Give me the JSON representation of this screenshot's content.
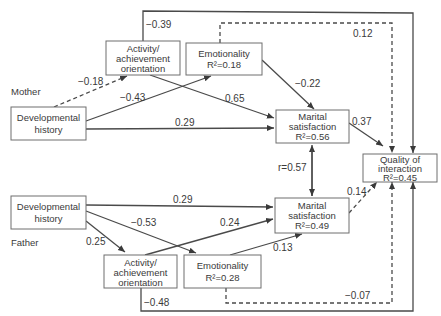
{
  "groups": {
    "mother": "Mother",
    "father": "Father"
  },
  "nodes": {
    "mother_dev": {
      "line1": "Developmental",
      "line2": "history"
    },
    "mother_activity": {
      "line1": "Activity/",
      "line2": "achievement",
      "line3": "orientation"
    },
    "mother_emotion": {
      "line1": "Emotionality",
      "r2": "R²=0.18"
    },
    "mother_marital": {
      "line1": "Marital",
      "line2": "satisfaction",
      "r2": "R²=0.56"
    },
    "quality": {
      "line1": "Quality of",
      "line2": "interaction",
      "r2": "R²=0.45"
    },
    "father_dev": {
      "line1": "Developmental",
      "line2": "history"
    },
    "father_activity": {
      "line1": "Activity/",
      "line2": "achievement",
      "line3": "orientation"
    },
    "father_emotion": {
      "line1": "Emotionality",
      "r2": "R²=0.28"
    },
    "father_marital": {
      "line1": "Marital",
      "line2": "satisfaction",
      "r2": "R²=0.49"
    }
  },
  "paths": {
    "m_activity_quality": "−0.39",
    "m_emotion_quality": "0.12",
    "m_dev_activity": "−0.18",
    "m_dev_emotion": "−0.43",
    "m_emotion_marital": "−0.22",
    "m_activity_marital": "0.65",
    "m_dev_marital": "0.29",
    "m_marital_quality": "0.37",
    "marital_correlation": "r=0.57",
    "f_dev_marital": "0.29",
    "f_dev_emotion": "−0.53",
    "f_activity_marital": "0.24",
    "f_dev_activity": "0.25",
    "f_emotion_marital": "0.13",
    "f_marital_quality": "0.14",
    "f_emotion_quality": "−0.07",
    "f_activity_quality": "−0.48"
  },
  "legend": {
    "solid": "significant path",
    "dashed": "non-significant path"
  }
}
